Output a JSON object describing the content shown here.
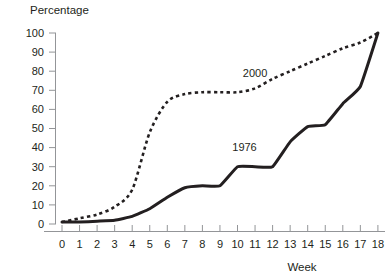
{
  "chart_data": {
    "type": "line",
    "title": "",
    "ylabel": "Percentage",
    "xlabel": "Week",
    "xlim": [
      -0.6,
      18.4
    ],
    "ylim": [
      0,
      100
    ],
    "grid": false,
    "legend_position": "inline-annotation",
    "x_ticks": [
      "0",
      "1",
      "2",
      "3",
      "4",
      "5",
      "6",
      "7",
      "8",
      "9",
      "10",
      "11",
      "12",
      "13",
      "14",
      "15",
      "16",
      "17",
      "18"
    ],
    "y_ticks": [
      "0",
      "10",
      "20",
      "30",
      "40",
      "50",
      "60",
      "70",
      "80",
      "90",
      "100"
    ],
    "x": [
      0,
      1,
      2,
      3,
      4,
      5,
      6,
      7,
      8,
      9,
      10,
      11,
      12,
      13,
      14,
      15,
      16,
      17,
      18
    ],
    "series": [
      {
        "name": "2000",
        "style": "dashed",
        "color": "#231f20",
        "label_text": "2000",
        "values": [
          1,
          3,
          5,
          9,
          18,
          48,
          64,
          68,
          69,
          69,
          69,
          71,
          76,
          80,
          84,
          88,
          92,
          95,
          100
        ]
      },
      {
        "name": "1976",
        "style": "solid",
        "color": "#231f20",
        "label_text": "1976",
        "values": [
          1,
          1,
          1.5,
          2,
          4,
          8,
          14,
          19,
          20,
          20,
          30,
          30,
          30,
          43,
          51,
          52,
          63,
          72,
          100
        ]
      }
    ],
    "annotations": [
      {
        "text": "2000",
        "x": 11.0,
        "y": 77,
        "name": "series-label-2000"
      },
      {
        "text": "1976",
        "x": 10.4,
        "y": 38,
        "name": "series-label-1976"
      }
    ]
  }
}
